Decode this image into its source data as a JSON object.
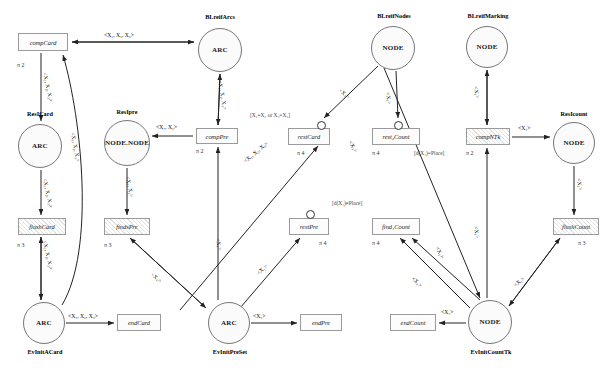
{
  "diagram": {
    "kind": "petri-net",
    "background": "#ffffff",
    "node_stroke": "#777777",
    "edge_color": "#222222"
  },
  "places": [
    {
      "id": "blreifarcs",
      "name": "BLreifArcs",
      "text": "ARC",
      "x": 198,
      "y": 28,
      "w": 44,
      "h": 44,
      "name_x": 196,
      "name_y": 13,
      "name_w": 48
    },
    {
      "id": "resicard",
      "name": "ResICard",
      "text": "ARC",
      "x": 18,
      "y": 124,
      "w": 44,
      "h": 44,
      "name_x": 16,
      "name_y": 110,
      "name_w": 48
    },
    {
      "id": "resipre",
      "name": "ResIpre",
      "text": "NODE.NODE",
      "x": 104,
      "y": 120,
      "w": 46,
      "h": 46,
      "name_x": 104,
      "name_y": 108,
      "name_w": 46
    },
    {
      "id": "blreifnodes",
      "name": "BLreifNodes",
      "text": "NODE",
      "x": 371,
      "y": 26,
      "w": 44,
      "h": 44,
      "name_x": 369,
      "name_y": 12,
      "name_w": 50
    },
    {
      "id": "blreifmark",
      "name": "BLreifMarking",
      "text": "NODE",
      "x": 466,
      "y": 26,
      "w": 42,
      "h": 42,
      "name_x": 459,
      "name_y": 12,
      "name_w": 58
    },
    {
      "id": "resicount",
      "name": "ResIcount",
      "text": "NODE",
      "x": 553,
      "y": 122,
      "w": 42,
      "h": 42,
      "name_x": 550,
      "name_y": 110,
      "name_w": 48
    },
    {
      "id": "evinitacard",
      "name": "EvInitACard",
      "text": "ARC",
      "x": 23,
      "y": 302,
      "w": 42,
      "h": 42,
      "name_x": 18,
      "name_y": 348,
      "name_w": 54
    },
    {
      "id": "evinitpreset",
      "name": "EvInitPreSet",
      "text": "ARC",
      "x": 208,
      "y": 302,
      "w": 42,
      "h": 42,
      "name_x": 202,
      "name_y": 348,
      "name_w": 56
    },
    {
      "id": "evinitcounttk",
      "name": "EvInitCountTk",
      "text": "NODE",
      "x": 468,
      "y": 300,
      "w": 44,
      "h": 44,
      "name_x": 460,
      "name_y": 348,
      "name_w": 62
    }
  ],
  "transitions": [
    {
      "id": "compcard",
      "label": "compCard",
      "x": 18,
      "y": 33,
      "w": 50,
      "h": 18,
      "hatch": false
    },
    {
      "id": "comppre",
      "label": "compPre",
      "x": 196,
      "y": 128,
      "w": 42,
      "h": 16,
      "hatch": false
    },
    {
      "id": "flushcard",
      "label": "flushCard",
      "x": 18,
      "y": 218,
      "w": 48,
      "h": 17,
      "hatch": true
    },
    {
      "id": "findspre",
      "label": "findsPre",
      "x": 104,
      "y": 218,
      "w": 46,
      "h": 17,
      "hatch": true
    },
    {
      "id": "endcard",
      "label": "endCard",
      "x": 117,
      "y": 314,
      "w": 44,
      "h": 17,
      "hatch": false
    },
    {
      "id": "endpre",
      "label": "endPre",
      "x": 300,
      "y": 314,
      "w": 42,
      "h": 17,
      "hatch": false
    },
    {
      "id": "restcard",
      "label": "restCard",
      "x": 288,
      "y": 128,
      "w": 42,
      "h": 17,
      "hatch": false
    },
    {
      "id": "restpre",
      "label": "restPre",
      "x": 289,
      "y": 218,
      "w": 40,
      "h": 17,
      "hatch": false
    },
    {
      "id": "restcount",
      "label": "rest₂Count",
      "x": 372,
      "y": 128,
      "w": 48,
      "h": 17,
      "hatch": false
    },
    {
      "id": "findcount",
      "label": "find₁Count",
      "x": 372,
      "y": 218,
      "w": 48,
      "h": 17,
      "hatch": false
    },
    {
      "id": "endcount",
      "label": "endCount",
      "x": 390,
      "y": 314,
      "w": 46,
      "h": 17,
      "hatch": false
    },
    {
      "id": "compntk",
      "label": "compNTk",
      "x": 466,
      "y": 128,
      "w": 44,
      "h": 17,
      "hatch": true
    },
    {
      "id": "flushcount",
      "label": "flushCount",
      "x": 553,
      "y": 218,
      "w": 46,
      "h": 17,
      "hatch": true
    }
  ],
  "dots": [
    {
      "id": "dot-restcard",
      "x": 317,
      "y": 121,
      "d": 9
    },
    {
      "id": "dot-restcount",
      "x": 394,
      "y": 121,
      "d": 9
    },
    {
      "id": "dot-restpre",
      "x": 306,
      "y": 210,
      "d": 9
    }
  ],
  "edge_labels": [
    {
      "id": "el-compcard-blreifarcs",
      "text": "<X₁, X₂, X₃>",
      "x": 104,
      "y": 33,
      "rot": 0
    },
    {
      "id": "el-compcard-resicard",
      "text": "<X₁, X₂, X₃>",
      "x": 47,
      "y": 72,
      "rot": 78
    },
    {
      "id": "el-resicard-flushcard",
      "text": "<X₁, X₂, X₃>",
      "x": 47,
      "y": 178,
      "rot": 78
    },
    {
      "id": "el-flush-evinitacard",
      "text": "<X₁, X₂, X₃>",
      "x": 47,
      "y": 240,
      "rot": 78
    },
    {
      "id": "el-evinit-compcard",
      "text": "<X₁, X₂, X₃>",
      "x": 75,
      "y": 132,
      "rot": 80
    },
    {
      "id": "el-evinitacard-endcard",
      "text": "<X₁, X₂, X₃>",
      "x": 68,
      "y": 314,
      "rot": 0
    },
    {
      "id": "el-blreifarcs-comppre",
      "text": "<X₁, X₂, X₃>",
      "x": 222,
      "y": 80,
      "rot": 80
    },
    {
      "id": "el-comppre-resipre",
      "text": "<X₁, X₂>",
      "x": 156,
      "y": 125,
      "rot": 0
    },
    {
      "id": "el-resipre-findspre",
      "text": "<X₁, X₂>",
      "x": 130,
      "y": 176,
      "rot": 80
    },
    {
      "id": "el-comppre-evinitpre",
      "text": "<X₁>",
      "x": 220,
      "y": 238,
      "rot": 80
    },
    {
      "id": "el-evinitpre-restcard",
      "text": "<X₁, X₂, X₃>",
      "x": 243,
      "y": 160,
      "rot": -40
    },
    {
      "id": "el-evinitpre-restpre",
      "text": "<X₁>",
      "x": 256,
      "y": 272,
      "rot": -42
    },
    {
      "id": "el-findspre-evinitpre",
      "text": "<X₁>",
      "x": 153,
      "y": 272,
      "rot": 40
    },
    {
      "id": "el-evinitpre-endpre",
      "text": "<X₁>",
      "x": 253,
      "y": 314,
      "rot": 0
    },
    {
      "id": "el-blnodes-restcard",
      "text": "<X₁>",
      "x": 341,
      "y": 88,
      "rot": 40
    },
    {
      "id": "el-blnodes-restcount",
      "text": "<X₁>",
      "x": 390,
      "y": 92,
      "rot": 82
    },
    {
      "id": "el-blnodes-evcount",
      "text": "<X₁>",
      "x": 352,
      "y": 140,
      "rot": 60
    },
    {
      "id": "el-evcount-restcount",
      "text": "<X₁>",
      "x": 439,
      "y": 246,
      "rot": 62
    },
    {
      "id": "el-evcount-findcount",
      "text": "<X₁>",
      "x": 414,
      "y": 276,
      "rot": 44
    },
    {
      "id": "el-evcount-flushcount",
      "text": "<X₁>",
      "x": 513,
      "y": 284,
      "rot": -40
    },
    {
      "id": "el-blmark-compntk",
      "text": "<X₁>",
      "x": 478,
      "y": 86,
      "rot": 82
    },
    {
      "id": "el-compntk-resicount",
      "text": "<X₁>",
      "x": 518,
      "y": 126,
      "rot": 0
    },
    {
      "id": "el-resicount-flush",
      "text": "<X₁>",
      "x": 581,
      "y": 178,
      "rot": 82
    },
    {
      "id": "el-compntk-evcount",
      "text": "<X₁>",
      "x": 478,
      "y": 226,
      "rot": 82
    },
    {
      "id": "el-evcount-endcount",
      "text": "<X₁>",
      "x": 441,
      "y": 310,
      "rot": 0
    }
  ],
  "guards": [
    {
      "id": "guard-restcard",
      "text": "[X₁=X₂ or X₃=X₄]",
      "x": 250,
      "y": 112
    },
    {
      "id": "guard-restcount",
      "text": "[d(X₁)=Place]",
      "x": 414,
      "y": 150
    },
    {
      "id": "guard-findcount",
      "text": "[d(X₁)≠Place]",
      "x": 332,
      "y": 200
    }
  ],
  "pi_labels": [
    {
      "id": "pi-compcard",
      "text": "π 2",
      "x": 17,
      "y": 62
    },
    {
      "id": "pi-comppre",
      "text": "π 2",
      "x": 196,
      "y": 148
    },
    {
      "id": "pi-flushcard",
      "text": "π 3",
      "x": 17,
      "y": 242
    },
    {
      "id": "pi-findspre",
      "text": "π 3",
      "x": 104,
      "y": 242
    },
    {
      "id": "pi-restcard",
      "text": "π 4",
      "x": 297,
      "y": 150
    },
    {
      "id": "pi-restcount",
      "text": "π 4",
      "x": 372,
      "y": 150
    },
    {
      "id": "pi-restpre",
      "text": "π 4",
      "x": 319,
      "y": 240
    },
    {
      "id": "pi-findcount",
      "text": "π 4",
      "x": 372,
      "y": 240
    },
    {
      "id": "pi-compntk",
      "text": "π 2",
      "x": 466,
      "y": 150
    },
    {
      "id": "pi-flushcount",
      "text": "π 3",
      "x": 578,
      "y": 240
    }
  ]
}
